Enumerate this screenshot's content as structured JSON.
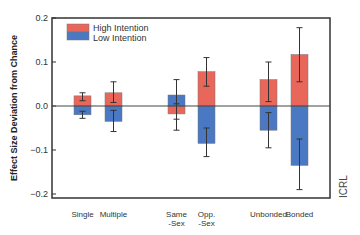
{
  "chart_data": {
    "type": "bar",
    "title": "",
    "xlabel": "",
    "ylabel": "Effect Size Deviation from Chance",
    "ylim": [
      -0.2,
      0.2
    ],
    "yticks": [
      "0.2",
      "0.1",
      "0.0",
      "−0.1",
      "−0.2"
    ],
    "ytick_values": [
      0.2,
      0.1,
      0.0,
      -0.1,
      -0.2
    ],
    "grid": false,
    "legend_position": "upper-left",
    "categories": [
      {
        "line1": "Single",
        "line2": ""
      },
      {
        "line1": "Multiple",
        "line2": ""
      },
      {
        "line1": "Same",
        "line2": "-Sex"
      },
      {
        "line1": "Opp.",
        "line2": "-Sex"
      },
      {
        "line1": "Unbonded",
        "line2": ""
      },
      {
        "line1": "Bonded",
        "line2": ""
      }
    ],
    "series": [
      {
        "name": "High Intention",
        "color": "#e8675a",
        "values": [
          0.023,
          0.03,
          -0.018,
          0.078,
          0.06,
          0.117
        ],
        "error_low": [
          0.012,
          0.008,
          -0.03,
          0.045,
          0.01,
          0.055
        ],
        "error_high": [
          0.03,
          0.055,
          0.005,
          0.11,
          0.1,
          0.178
        ]
      },
      {
        "name": "Low Intention",
        "color": "#4a78c2",
        "values": [
          -0.02,
          -0.035,
          0.025,
          -0.085,
          -0.055,
          -0.135
        ],
        "error_low": [
          -0.028,
          -0.058,
          -0.055,
          -0.115,
          -0.095,
          -0.19
        ],
        "error_high": [
          -0.012,
          -0.01,
          0.06,
          -0.05,
          -0.015,
          -0.075
        ]
      }
    ],
    "annotations": [
      "ICRL"
    ]
  },
  "legend": {
    "high_label": "High Intention",
    "low_label": "Low Intention"
  },
  "watermark": "ICRL"
}
